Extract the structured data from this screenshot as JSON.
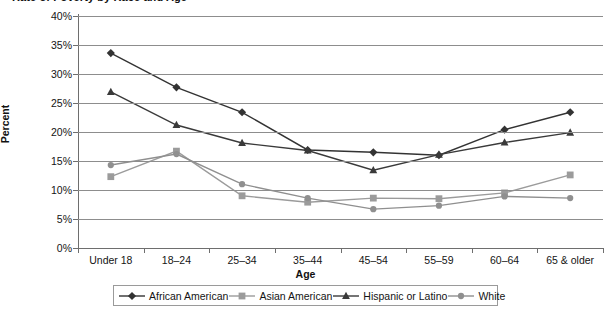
{
  "chart_data": {
    "type": "line",
    "title": "Rate of Poverty by Race and Age",
    "xlabel": "Age",
    "ylabel": "Percent",
    "ylim": [
      0,
      40
    ],
    "ytick_labels": [
      "40%",
      "35%",
      "30%",
      "25%",
      "20%",
      "15%",
      "10%",
      "5%",
      "0%"
    ],
    "ytick_values": [
      40,
      35,
      30,
      25,
      20,
      15,
      10,
      5,
      0
    ],
    "grid": true,
    "legend_position": "bottom",
    "categories": [
      "Under 18",
      "18–24",
      "25–34",
      "35–44",
      "45–54",
      "55–59",
      "60–64",
      "65 & older"
    ],
    "series": [
      {
        "name": "African American",
        "marker": "diamond",
        "color": "#333333",
        "values": [
          33.6,
          27.7,
          23.4,
          16.9,
          16.5,
          16.0,
          20.4,
          23.4
        ]
      },
      {
        "name": "Asian American",
        "marker": "square",
        "color": "#9b9b9b",
        "values": [
          12.3,
          16.7,
          9.0,
          7.9,
          8.6,
          8.5,
          9.5,
          12.6
        ]
      },
      {
        "name": "Hispanic or Latino",
        "marker": "triangle",
        "color": "#3a3a3a",
        "values": [
          26.9,
          21.2,
          18.1,
          16.8,
          13.4,
          16.1,
          18.2,
          19.9
        ]
      },
      {
        "name": "White",
        "marker": "circle",
        "color": "#8f8f8f",
        "values": [
          14.3,
          16.2,
          11.0,
          8.6,
          6.7,
          7.3,
          8.9,
          8.6
        ]
      }
    ]
  },
  "colors": {
    "gridline": "#8d8d8d",
    "axis": "#6e6e6e",
    "text": "#141414",
    "background": "#ffffff"
  }
}
